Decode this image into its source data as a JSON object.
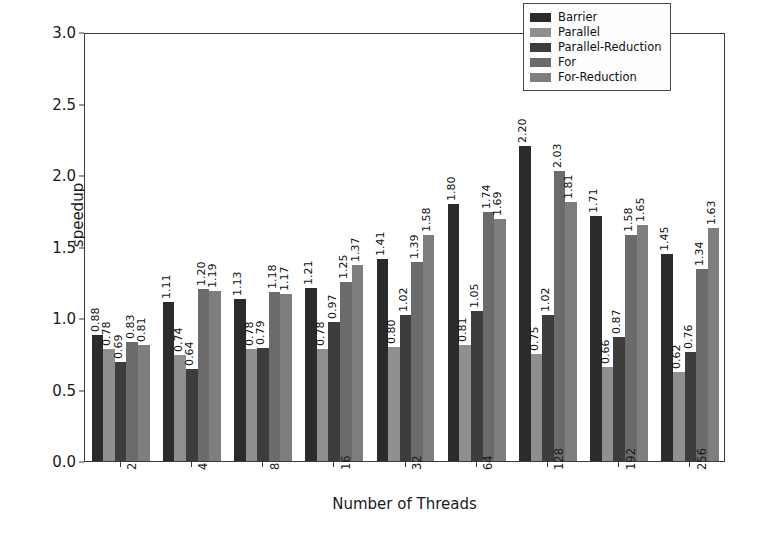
{
  "chart_data": {
    "type": "bar",
    "title": "",
    "xlabel": "Number of Threads",
    "ylabel": "speedup",
    "categories": [
      "2",
      "4",
      "8",
      "16",
      "32",
      "64",
      "128",
      "192",
      "256"
    ],
    "ylim": [
      0.0,
      3.0
    ],
    "yticks": [
      "0.0",
      "0.5",
      "1.0",
      "1.5",
      "2.0",
      "2.5",
      "3.0"
    ],
    "grid": false,
    "legend_position": "upper right",
    "series": [
      {
        "name": "Barrier",
        "color": "#2b2b2b",
        "values": [
          0.88,
          1.11,
          1.13,
          1.21,
          1.41,
          1.8,
          2.2,
          1.71,
          1.45
        ],
        "labels": [
          "0.88",
          "1.11",
          "1.13",
          "1.21",
          "1.41",
          "1.80",
          "2.20",
          "1.71",
          "1.45"
        ]
      },
      {
        "name": "Parallel",
        "color": "#8f8f8f",
        "values": [
          0.78,
          0.74,
          0.78,
          0.78,
          0.8,
          0.81,
          0.75,
          0.66,
          0.62
        ],
        "labels": [
          "0.78",
          "0.74",
          "0.78",
          "0.78",
          "0.80",
          "0.81",
          "0.75",
          "0.66",
          "0.62"
        ]
      },
      {
        "name": "Parallel-Reduction",
        "color": "#3d3d3d",
        "values": [
          0.69,
          0.64,
          0.79,
          0.97,
          1.02,
          1.05,
          1.02,
          0.87,
          0.76
        ],
        "labels": [
          "0.69",
          "0.64",
          "0.79",
          "0.97",
          "1.02",
          "1.05",
          "1.02",
          "0.87",
          "0.76"
        ]
      },
      {
        "name": "For",
        "color": "#6b6b6b",
        "values": [
          0.83,
          1.2,
          1.18,
          1.25,
          1.39,
          1.74,
          2.03,
          1.58,
          1.34
        ],
        "labels": [
          "0.83",
          "1.20",
          "1.18",
          "1.25",
          "1.39",
          "1.74",
          "2.03",
          "1.58",
          "1.34"
        ]
      },
      {
        "name": "For-Reduction",
        "color": "#7e7e7e",
        "values": [
          0.81,
          1.19,
          1.17,
          1.37,
          1.58,
          1.69,
          1.81,
          1.65,
          1.63
        ],
        "labels": [
          "0.81",
          "1.19",
          "1.17",
          "1.37",
          "1.58",
          "1.69",
          "1.81",
          "1.65",
          "1.63"
        ]
      }
    ]
  }
}
